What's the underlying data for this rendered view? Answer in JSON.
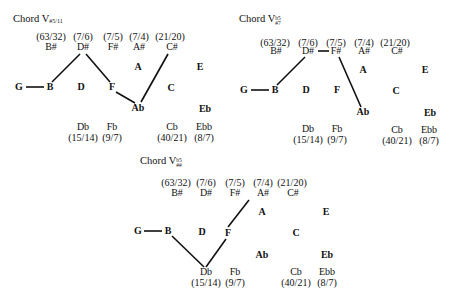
{
  "diagrams": [
    {
      "title": {
        "main": "Chord V",
        "sup": "",
        "sub": "#5/11"
      },
      "top_ratios": [
        "(63/32)",
        "(7/6)",
        "(7/5)",
        "(7/4)",
        "(21/20)"
      ],
      "top_notes": [
        "B#",
        "D#",
        "F#",
        "A#",
        "C#"
      ],
      "upper_bold": [
        "A",
        "E"
      ],
      "middle_bold": [
        "G",
        "B",
        "D",
        "F",
        "C"
      ],
      "lower_bold": [
        "Ab",
        "Eb"
      ],
      "bottom_notes": [
        "Db",
        "Fb",
        "Cb",
        "Ebb"
      ],
      "bottom_ratios": [
        "(15/14)",
        "(9/7)",
        "(40/21)",
        "(8/7)"
      ],
      "path": [
        "G",
        "B",
        "D#",
        "F",
        "Ab",
        "C#"
      ]
    },
    {
      "title": {
        "main": "Chord V",
        "sup": "b5",
        "sub": "#7"
      },
      "top_ratios": [
        "(63/32)",
        "(7/6)",
        "(7/5)",
        "(7/4)",
        "(21/20)"
      ],
      "top_notes": [
        "B#",
        "D#",
        "F#",
        "A#",
        "C#"
      ],
      "upper_bold": [
        "A",
        "E"
      ],
      "middle_bold": [
        "G",
        "B",
        "D",
        "F",
        "C"
      ],
      "lower_bold": [
        "Ab",
        "Eb"
      ],
      "bottom_notes": [
        "Db",
        "Fb",
        "Cb",
        "Ebb"
      ],
      "bottom_ratios": [
        "(15/14)",
        "(9/7)",
        "(40/21)",
        "(8/7)"
      ],
      "path": [
        "G",
        "B",
        "D#",
        "F#",
        "Ab"
      ]
    },
    {
      "title": {
        "main": "Chord V",
        "sup": "b5",
        "sub": "##"
      },
      "top_ratios": [
        "(63/32)",
        "(7/6)",
        "(7/5)",
        "(7/4)",
        "(21/20)"
      ],
      "top_notes": [
        "B#",
        "D#",
        "F#",
        "A#",
        "C#"
      ],
      "upper_bold": [
        "A",
        "E"
      ],
      "middle_bold": [
        "G",
        "B",
        "D",
        "F",
        "C"
      ],
      "lower_bold": [
        "Ab",
        "Eb"
      ],
      "bottom_notes": [
        "Db",
        "Fb",
        "Cb",
        "Ebb"
      ],
      "bottom_ratios": [
        "(15/14)",
        "(9/7)",
        "(40/21)",
        "(8/7)"
      ],
      "path": [
        "G",
        "B",
        "Db",
        "F",
        "A#"
      ]
    }
  ]
}
